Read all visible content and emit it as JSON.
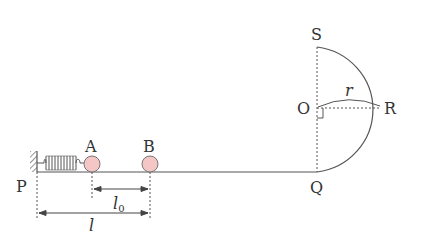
{
  "diagram": {
    "labels": {
      "P": "P",
      "A": "A",
      "B": "B",
      "Q": "Q",
      "O": "O",
      "R": "R",
      "S": "S",
      "r": "r",
      "l0_main": "l",
      "l0_sub": "0",
      "l": "l"
    },
    "colors": {
      "line": "#555555",
      "ball_fill": "#f4c6c6",
      "ball_stroke": "#777777",
      "text": "#333333"
    }
  }
}
